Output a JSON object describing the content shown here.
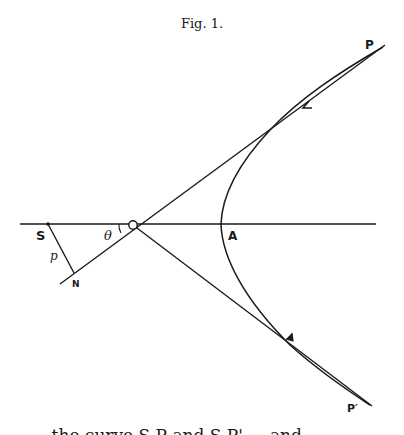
{
  "figure": {
    "caption": "Fig. 1.",
    "labels": {
      "S": "S",
      "p": "p",
      "N": "N",
      "theta": "θ",
      "A": "A",
      "P": "P",
      "P_prime": "P′"
    },
    "colors": {
      "ink": "#1a1a1a",
      "paper": "#ffffff"
    }
  },
  "footer_text": "... the curve S P and S P' ... and ..."
}
